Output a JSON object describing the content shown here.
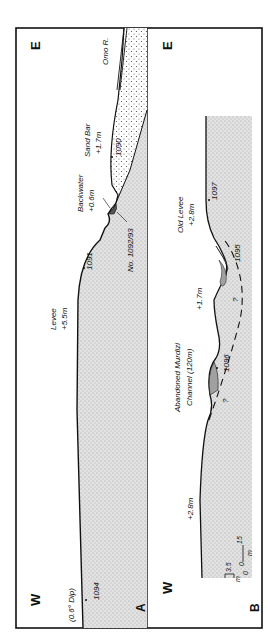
{
  "figure": {
    "orientation": "rotated 90 degrees counter-clockwise",
    "panels": [
      {
        "id": "A",
        "panel_label": "A",
        "west_label": "W",
        "east_label": "E",
        "labels": {
          "dip": "(0.6° Dip)",
          "levee": "Levee",
          "levee_height": "+5.5m",
          "backwater": "Backwater",
          "backwater_height": "+0.6m",
          "sand_bar": "Sand Bar",
          "sand_bar_height": "+1.7m",
          "river": "Omo R.",
          "sample_range": "No. 1092/93"
        },
        "samples": [
          "1094",
          "1091",
          "1090"
        ]
      },
      {
        "id": "B",
        "panel_label": "B",
        "west_label": "W",
        "east_label": "E",
        "labels": {
          "west_height": "+2.8m",
          "channel_line1": "Abandoned Murdizi",
          "channel_line2": "Channel (120m)",
          "mid_height": "+1.7m",
          "old_levee": "Old Levee",
          "old_levee_height": "+2.8m",
          "question_marks": [
            "?",
            "?"
          ]
        },
        "samples": [
          "1096",
          "1095",
          "1097"
        ],
        "scale": {
          "vertical_max": "3.5",
          "vertical_min": "0",
          "vertical_unit": "m",
          "horizontal_min": "0",
          "horizontal_max": "15",
          "horizontal_unit": "m"
        }
      }
    ],
    "colors": {
      "line": "#111111",
      "fill_stipple": "#cfcfcf",
      "background": "#ffffff"
    }
  }
}
